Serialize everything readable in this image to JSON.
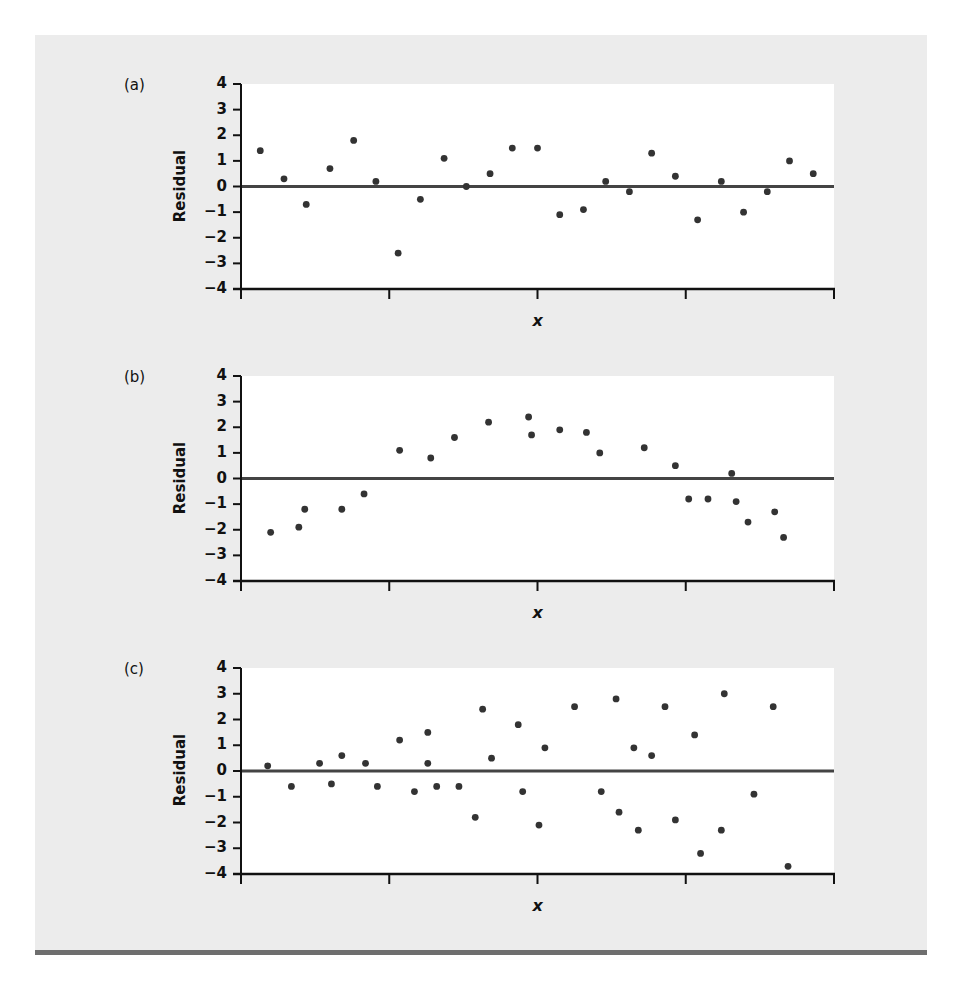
{
  "figure": {
    "background_color": "#ececec",
    "plot_background": "#ffffff",
    "point_color": "#333333",
    "axis_color": "#111111",
    "rule_color": "#6e6e6e"
  },
  "panels": [
    {
      "label": "(a)",
      "ylabel": "Residual",
      "xlabel": "x",
      "yticks": [
        "4",
        "3",
        "2",
        "1",
        "0",
        "−1",
        "−2",
        "−3",
        "−4"
      ]
    },
    {
      "label": "(b)",
      "ylabel": "Residual",
      "xlabel": "x",
      "yticks": [
        "4",
        "3",
        "2",
        "1",
        "0",
        "−1",
        "−2",
        "−3",
        "−4"
      ]
    },
    {
      "label": "(c)",
      "ylabel": "Residual",
      "xlabel": "x",
      "yticks": [
        "4",
        "3",
        "2",
        "1",
        "0",
        "−1",
        "−2",
        "−3",
        "−4"
      ]
    }
  ],
  "chart_data": [
    {
      "type": "scatter",
      "title": "(a)",
      "xlabel": "x",
      "ylabel": "Residual",
      "ylim": [
        -4,
        4
      ],
      "yticks": [
        4,
        3,
        2,
        1,
        0,
        -1,
        -2,
        -3,
        -4
      ],
      "xlim": [
        0,
        4
      ],
      "xticks_unlabeled": [
        0,
        1,
        2,
        3,
        4
      ],
      "reference_line": 0,
      "grid": false,
      "x": [
        0.13,
        0.29,
        0.44,
        0.6,
        0.76,
        0.91,
        1.06,
        1.21,
        1.37,
        1.52,
        1.68,
        1.83,
        2.0,
        2.15,
        2.31,
        2.46,
        2.62,
        2.77,
        2.93,
        3.08,
        3.24,
        3.39,
        3.55,
        3.7,
        3.86
      ],
      "y": [
        1.4,
        0.3,
        -0.7,
        0.7,
        1.8,
        0.2,
        -2.6,
        -0.5,
        1.1,
        0.0,
        0.5,
        1.5,
        1.5,
        -1.1,
        -0.9,
        0.2,
        -0.2,
        1.3,
        0.4,
        -1.3,
        0.2,
        -1.0,
        -0.2,
        1.0,
        0.5
      ]
    },
    {
      "type": "scatter",
      "title": "(b)",
      "xlabel": "x",
      "ylabel": "Residual",
      "ylim": [
        -4,
        4
      ],
      "yticks": [
        4,
        3,
        2,
        1,
        0,
        -1,
        -2,
        -3,
        -4
      ],
      "xlim": [
        0,
        4
      ],
      "xticks_unlabeled": [
        0,
        1,
        2,
        3,
        4
      ],
      "reference_line": 0,
      "grid": false,
      "x": [
        0.2,
        0.39,
        0.43,
        0.68,
        0.83,
        1.07,
        1.28,
        1.44,
        1.67,
        1.94,
        1.96,
        2.15,
        2.33,
        2.42,
        2.72,
        2.93,
        3.02,
        3.15,
        3.31,
        3.34,
        3.42,
        3.6,
        3.66
      ],
      "y": [
        -2.1,
        -1.9,
        -1.2,
        -1.2,
        -0.6,
        1.1,
        0.8,
        1.6,
        2.2,
        2.4,
        1.7,
        1.9,
        1.8,
        1.0,
        1.2,
        0.5,
        -0.8,
        -0.8,
        0.2,
        -0.9,
        -1.7,
        -1.3,
        -2.3
      ]
    },
    {
      "type": "scatter",
      "title": "(c)",
      "xlabel": "x",
      "ylabel": "Residual",
      "ylim": [
        -4,
        4
      ],
      "yticks": [
        4,
        3,
        2,
        1,
        0,
        -1,
        -2,
        -3,
        -4
      ],
      "xlim": [
        0,
        4
      ],
      "xticks_unlabeled": [
        0,
        1,
        2,
        3,
        4
      ],
      "reference_line": 0,
      "grid": false,
      "x": [
        0.18,
        0.34,
        0.53,
        0.61,
        0.68,
        0.84,
        0.92,
        1.07,
        1.17,
        1.26,
        1.26,
        1.32,
        1.47,
        1.58,
        1.63,
        1.69,
        1.87,
        1.9,
        2.01,
        2.05,
        2.25,
        2.43,
        2.53,
        2.55,
        2.65,
        2.68,
        2.77,
        2.86,
        2.93,
        3.06,
        3.1,
        3.24,
        3.26,
        3.46,
        3.59,
        3.69
      ],
      "y": [
        0.2,
        -0.6,
        0.3,
        -0.5,
        0.6,
        0.3,
        -0.6,
        1.2,
        -0.8,
        1.5,
        0.3,
        -0.6,
        -0.6,
        -1.8,
        2.4,
        0.5,
        1.8,
        -0.8,
        -2.1,
        0.9,
        2.5,
        -0.8,
        2.8,
        -1.6,
        0.9,
        -2.3,
        0.6,
        2.5,
        -1.9,
        1.4,
        -3.2,
        -2.3,
        3.0,
        -0.9,
        2.5,
        -3.7
      ]
    }
  ]
}
